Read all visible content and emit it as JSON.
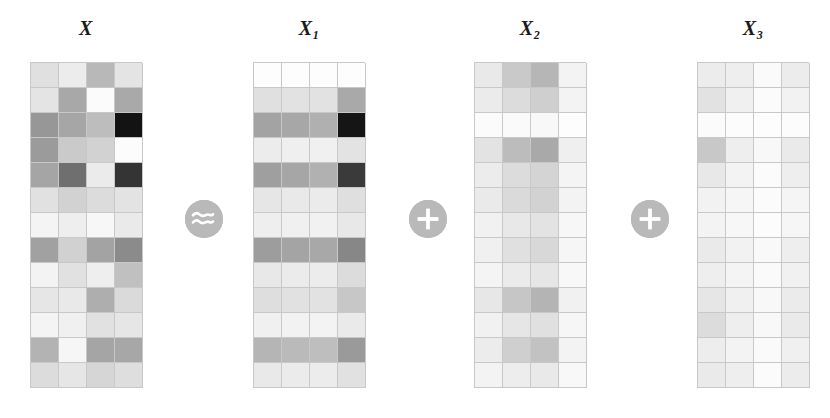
{
  "figure": {
    "type": "matrix-decomposition-diagram",
    "relation": "X ≈ X1 + X2 + X3",
    "rows": 13,
    "cols": 4,
    "cell_width": 28,
    "cell_height": 25,
    "colormap": "grayscale",
    "background": "#ffffff",
    "grid_line_color": "#c8c8c8",
    "label_color": "#1a1a1a"
  },
  "labels": {
    "x": {
      "base": "X",
      "sub": ""
    },
    "x1": {
      "base": "X",
      "sub": "1"
    },
    "x2": {
      "base": "X",
      "sub": "2"
    },
    "x3": {
      "base": "X",
      "sub": "3"
    }
  },
  "operators": [
    {
      "name": "approximately-equal",
      "glyph": "≈",
      "color": "#b9b9b9",
      "icon_color": "#ffffff",
      "x": 185,
      "y": 200
    },
    {
      "name": "plus",
      "glyph": "+",
      "color": "#b9b9b9",
      "icon_color": "#ffffff",
      "x": 409,
      "y": 200
    },
    {
      "name": "plus",
      "glyph": "+",
      "color": "#b9b9b9",
      "icon_color": "#ffffff",
      "x": 631,
      "y": 200
    }
  ],
  "matrices": {
    "x": {
      "label": "X",
      "left": 30,
      "width": 112,
      "cells": [
        [
          "#e0e0e0",
          "#ececec",
          "#b8b8b8",
          "#e4e4e4"
        ],
        [
          "#e4e4e4",
          "#a8a8a8",
          "#fbfbfb",
          "#a9a9a9"
        ],
        [
          "#979797",
          "#a6a6a6",
          "#bdbdbd",
          "#131313"
        ],
        [
          "#9b9b9b",
          "#cacaca",
          "#d2d2d2",
          "#fcfcfc"
        ],
        [
          "#a5a5a5",
          "#6f6f6f",
          "#ebebeb",
          "#343434"
        ],
        [
          "#e1e1e1",
          "#d2d2d2",
          "#dcdcdc",
          "#e3e3e3"
        ],
        [
          "#f4f4f4",
          "#eeeeee",
          "#f7f7f7",
          "#eaeaea"
        ],
        [
          "#a1a1a1",
          "#d1d1d1",
          "#a3a3a3",
          "#8b8b8b"
        ],
        [
          "#f3f3f3",
          "#e1e1e1",
          "#eeeeee",
          "#c0c0c0"
        ],
        [
          "#e6e6e6",
          "#e9e9e9",
          "#aeaeae",
          "#dadada"
        ],
        [
          "#f4f4f4",
          "#f0f0f0",
          "#e1e1e1",
          "#e6e6e6"
        ],
        [
          "#b3b3b3",
          "#f6f6f6",
          "#a5a5a5",
          "#a7a7a7"
        ],
        [
          "#dcdcdc",
          "#e6e6e6",
          "#d6d6d6",
          "#dedede"
        ]
      ]
    },
    "x1": {
      "label": "X1",
      "left": 253,
      "width": 112,
      "cells": [
        [
          "#fdfdfd",
          "#fdfdfd",
          "#fdfdfd",
          "#fdfdfd"
        ],
        [
          "#e0e0e0",
          "#e2e2e2",
          "#e2e2e2",
          "#a9a9a9"
        ],
        [
          "#a3a3a3",
          "#a7a7a7",
          "#b0b0b0",
          "#151515"
        ],
        [
          "#ececec",
          "#efefef",
          "#f0f0f0",
          "#e3e3e3"
        ],
        [
          "#9f9f9f",
          "#a6a6a6",
          "#b1b1b1",
          "#3a3a3a"
        ],
        [
          "#e6e6e6",
          "#e9e9e9",
          "#ebebeb",
          "#dfdfdf"
        ],
        [
          "#eeeeee",
          "#f0f0f0",
          "#f1f1f1",
          "#e8e8e8"
        ],
        [
          "#9d9d9d",
          "#a4a4a4",
          "#a8a8a8",
          "#878787"
        ],
        [
          "#e8e8e8",
          "#ebebeb",
          "#ececec",
          "#dcdcdc"
        ],
        [
          "#dedede",
          "#e1e1e1",
          "#e2e2e2",
          "#c7c7c7"
        ],
        [
          "#f0f0f0",
          "#f2f2f2",
          "#f3f3f3",
          "#eaeaea"
        ],
        [
          "#b5b5b5",
          "#bababa",
          "#bebebe",
          "#9a9a9a"
        ],
        [
          "#e9e9e9",
          "#ebebeb",
          "#ececec",
          "#e1e1e1"
        ]
      ]
    },
    "x2": {
      "label": "X2",
      "left": 474,
      "width": 112,
      "cells": [
        [
          "#e9e9e9",
          "#c9c9c9",
          "#b6b6b6",
          "#f3f3f3"
        ],
        [
          "#ebebeb",
          "#dcdcdc",
          "#cfcfcf",
          "#f3f3f3"
        ],
        [
          "#fbfbfb",
          "#fafafa",
          "#f8f8f8",
          "#fdfdfd"
        ],
        [
          "#e3e3e3",
          "#bcbcbc",
          "#a9a9a9",
          "#efefef"
        ],
        [
          "#ececec",
          "#dcdcdc",
          "#d4d4d4",
          "#f4f4f4"
        ],
        [
          "#eaeaea",
          "#dadada",
          "#d2d2d2",
          "#f3f3f3"
        ],
        [
          "#f1f1f1",
          "#e8e8e8",
          "#e3e3e3",
          "#f7f7f7"
        ],
        [
          "#f0f0f0",
          "#e0e0e0",
          "#d8d8d8",
          "#f6f6f6"
        ],
        [
          "#f4f4f4",
          "#ebebeb",
          "#e6e6e6",
          "#f8f8f8"
        ],
        [
          "#e7e7e7",
          "#c6c6c6",
          "#b4b4b4",
          "#f1f1f1"
        ],
        [
          "#f1f1f1",
          "#e6e6e6",
          "#e0e0e0",
          "#f6f6f6"
        ],
        [
          "#ececec",
          "#cfcfcf",
          "#c2c2c2",
          "#f3f3f3"
        ],
        [
          "#f3f3f3",
          "#ededed",
          "#e9e9e9",
          "#f8f8f8"
        ]
      ]
    },
    "x3": {
      "label": "X3",
      "left": 697,
      "width": 112,
      "cells": [
        [
          "#ececec",
          "#eeeeee",
          "#fafafa",
          "#ececec"
        ],
        [
          "#e2e2e2",
          "#f0f0f0",
          "#fbfbfb",
          "#f2f2f2"
        ],
        [
          "#fbfbfb",
          "#fcfcfc",
          "#fdfdfd",
          "#fcfcfc"
        ],
        [
          "#c8c8c8",
          "#eeeeee",
          "#f8f8f8",
          "#eaeaea"
        ],
        [
          "#e8e8e8",
          "#f3f3f3",
          "#fbfbfb",
          "#eeeeee"
        ],
        [
          "#f2f2f2",
          "#f6f6f6",
          "#fbfbfb",
          "#f5f5f5"
        ],
        [
          "#f3f3f3",
          "#f7f7f7",
          "#fcfcfc",
          "#f6f6f6"
        ],
        [
          "#eaeaea",
          "#f2f2f2",
          "#f9f9f9",
          "#eeeeee"
        ],
        [
          "#eeeeee",
          "#f4f4f4",
          "#fafafa",
          "#f1f1f1"
        ],
        [
          "#e6e6e6",
          "#f0f0f0",
          "#f8f8f8",
          "#ebebeb"
        ],
        [
          "#dcdcdc",
          "#eeeeee",
          "#f8f8f8",
          "#eaeaea"
        ],
        [
          "#ededed",
          "#f3f3f3",
          "#fafafa",
          "#f0f0f0"
        ],
        [
          "#eaeaea",
          "#eeeeee",
          "#fbfbfb",
          "#ececec"
        ]
      ]
    }
  }
}
